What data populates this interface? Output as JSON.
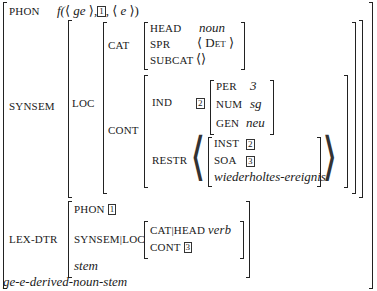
{
  "avm": {
    "type": "ge-e-derived-noun-stem",
    "phon": {
      "label": "PHON",
      "value_prefix": "f(",
      "lang_open": "⟨",
      "ge": "ge",
      "lang_close": "⟩,",
      "tag1": "1",
      "comma": ",",
      "e_open": "⟨",
      "e": "e",
      "e_close": "⟩)"
    },
    "synsem": {
      "label": "SYNSEM",
      "loc": {
        "label": "LOC",
        "cat": {
          "label": "CAT",
          "head_label": "HEAD",
          "head_value": "noun",
          "spr_label": "SPR",
          "spr_value": "⟨ Det ⟩",
          "subcat_label": "SUBCAT",
          "subcat_value": "⟨⟩"
        },
        "cont": {
          "label": "CONT",
          "ind": {
            "label": "IND",
            "tag": "2",
            "per_label": "PER",
            "per_value": "3",
            "num_label": "NUM",
            "num_value": "sg",
            "gen_label": "GEN",
            "gen_value": "neu"
          },
          "restr": {
            "label": "RESTR",
            "open": "⟨",
            "close": "⟩",
            "inst_label": "INST",
            "inst_tag": "2",
            "soa_label": "SOA",
            "soa_tag": "3",
            "type": "wiederholtes-ereignis"
          }
        }
      }
    },
    "lex_dtr": {
      "label": "LEX-DTR",
      "phon_label": "PHON",
      "phon_tag": "1",
      "synsem_loc_label": "SYNSEM|LOC",
      "cat_head_label": "CAT|HEAD",
      "cat_head_value": "verb",
      "cont_label": "CONT",
      "cont_tag": "3",
      "type": "stem"
    }
  }
}
